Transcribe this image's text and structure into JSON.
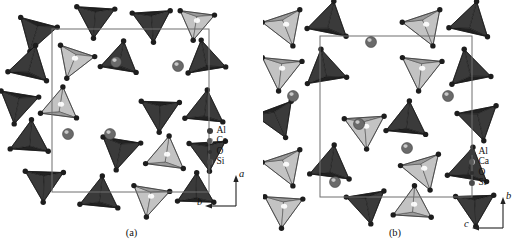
{
  "figure": {
    "type": "crystal-structure-projection-pair",
    "background_color": "#ffffff",
    "panels": [
      {
        "id": "a",
        "caption": "(a)",
        "legend": {
          "entries": [
            {
              "label": "Al",
              "marker": "filled-dark-circle",
              "color": "#3b3b3b",
              "size_px": 6
            },
            {
              "label": "Ca",
              "marker": "shaded-circle",
              "color": "#5a5a5a",
              "size_px": 6
            },
            {
              "label": "O",
              "marker": "small-dark-circle",
              "color": "#2e2e2e",
              "size_px": 4
            },
            {
              "label": "Si",
              "marker": "crescent-circle",
              "color": "#4a4a4a",
              "size_px": 6
            }
          ]
        },
        "axes": {
          "vertical": {
            "label": "a",
            "direction": "up"
          },
          "horizontal": {
            "label": "b",
            "direction": "left"
          }
        }
      },
      {
        "id": "b",
        "caption": "(b)",
        "legend": {
          "entries": [
            {
              "label": "Al",
              "marker": "filled-dark-circle",
              "color": "#3b3b3b",
              "size_px": 6
            },
            {
              "label": "Ca",
              "marker": "shaded-circle",
              "color": "#5a5a5a",
              "size_px": 6
            },
            {
              "label": "O",
              "marker": "small-dark-circle",
              "color": "#2e2e2e",
              "size_px": 4
            },
            {
              "label": "Si",
              "marker": "crescent-circle",
              "color": "#4a4a4a",
              "size_px": 6
            }
          ]
        },
        "axes": {
          "vertical": {
            "label": "b",
            "direction": "up"
          },
          "horizontal": {
            "label": "c",
            "direction": "left"
          }
        }
      }
    ]
  },
  "chart_data": {
    "type": "scatter",
    "title": "",
    "xlabel": "",
    "ylabel": "",
    "grid": false,
    "legend_position": "inside-lower-right",
    "panel_a": {
      "projection_axes": [
        "a",
        "b"
      ],
      "unit_cell_box": {
        "x": 52,
        "y": 29,
        "width": 157,
        "height": 163
      },
      "tetrahedra": [
        {
          "cx": 36,
          "cy": 32,
          "r": 22,
          "rot": 196,
          "shade": "dark"
        },
        {
          "cx": 95,
          "cy": 18,
          "r": 22,
          "rot": 184,
          "shade": "dark"
        },
        {
          "cx": 152,
          "cy": 22,
          "r": 22,
          "rot": 176,
          "shade": "dark"
        },
        {
          "cx": 196,
          "cy": 22,
          "r": 20,
          "rot": 188,
          "shade": "light"
        },
        {
          "cx": 30,
          "cy": 66,
          "r": 23,
          "rot": 14,
          "shade": "dark"
        },
        {
          "cx": 74,
          "cy": 60,
          "r": 21,
          "rot": 200,
          "shade": "light"
        },
        {
          "cx": 120,
          "cy": 60,
          "r": 21,
          "rot": 10,
          "shade": "dark"
        },
        {
          "cx": 205,
          "cy": 60,
          "r": 22,
          "rot": 350,
          "shade": "dark"
        },
        {
          "cx": 18,
          "cy": 104,
          "r": 22,
          "rot": 190,
          "shade": "dark"
        },
        {
          "cx": 60,
          "cy": 106,
          "r": 21,
          "rot": 8,
          "shade": "light"
        },
        {
          "cx": 160,
          "cy": 112,
          "r": 22,
          "rot": 182,
          "shade": "dark"
        },
        {
          "cx": 205,
          "cy": 110,
          "r": 22,
          "rot": 6,
          "shade": "dark"
        },
        {
          "cx": 30,
          "cy": 140,
          "r": 22,
          "rot": 4,
          "shade": "dark"
        },
        {
          "cx": 120,
          "cy": 150,
          "r": 22,
          "rot": 190,
          "shade": "dark"
        },
        {
          "cx": 166,
          "cy": 156,
          "r": 22,
          "rot": 8,
          "shade": "light"
        },
        {
          "cx": 208,
          "cy": 152,
          "r": 21,
          "rot": 176,
          "shade": "dark"
        },
        {
          "cx": 44,
          "cy": 182,
          "r": 22,
          "rot": 182,
          "shade": "dark"
        },
        {
          "cx": 100,
          "cy": 196,
          "r": 22,
          "rot": 6,
          "shade": "dark"
        },
        {
          "cx": 150,
          "cy": 198,
          "r": 21,
          "rot": 190,
          "shade": "light"
        },
        {
          "cx": 196,
          "cy": 192,
          "r": 21,
          "rot": 2,
          "shade": "dark"
        }
      ],
      "cations": [
        {
          "cx": 116,
          "cy": 62,
          "r": 5.5,
          "label": "Ca"
        },
        {
          "cx": 178,
          "cy": 66,
          "r": 5.5,
          "label": "Ca"
        },
        {
          "cx": 68,
          "cy": 134,
          "r": 5.5,
          "label": "Ca"
        },
        {
          "cx": 110,
          "cy": 134,
          "r": 5.5,
          "label": "Ca"
        }
      ]
    },
    "panel_b": {
      "projection_axes": [
        "b",
        "c"
      ],
      "unit_cell_box": {
        "x": 57,
        "y": 36,
        "width": 152,
        "height": 161
      },
      "tetrahedra": [
        {
          "cx": 22,
          "cy": 26,
          "r": 23,
          "rot": 160,
          "shade": "light"
        },
        {
          "cx": 66,
          "cy": 22,
          "r": 23,
          "rot": 12,
          "shade": "dark"
        },
        {
          "cx": 162,
          "cy": 26,
          "r": 23,
          "rot": 160,
          "shade": "light"
        },
        {
          "cx": 208,
          "cy": 22,
          "r": 23,
          "rot": 14,
          "shade": "dark"
        },
        {
          "cx": 18,
          "cy": 70,
          "r": 23,
          "rot": 186,
          "shade": "light"
        },
        {
          "cx": 62,
          "cy": 70,
          "r": 23,
          "rot": 350,
          "shade": "dark"
        },
        {
          "cx": 158,
          "cy": 70,
          "r": 23,
          "rot": 186,
          "shade": "light"
        },
        {
          "cx": 206,
          "cy": 70,
          "r": 23,
          "rot": 348,
          "shade": "dark"
        },
        {
          "cx": 14,
          "cy": 118,
          "r": 23,
          "rot": 158,
          "shade": "dark"
        },
        {
          "cx": 102,
          "cy": 128,
          "r": 23,
          "rot": 176,
          "shade": "light"
        },
        {
          "cx": 144,
          "cy": 122,
          "r": 23,
          "rot": 6,
          "shade": "dark"
        },
        {
          "cx": 216,
          "cy": 120,
          "r": 23,
          "rot": 168,
          "shade": "dark"
        },
        {
          "cx": 22,
          "cy": 166,
          "r": 23,
          "rot": 160,
          "shade": "light"
        },
        {
          "cx": 68,
          "cy": 166,
          "r": 23,
          "rot": 8,
          "shade": "dark"
        },
        {
          "cx": 160,
          "cy": 170,
          "r": 23,
          "rot": 162,
          "shade": "light"
        },
        {
          "cx": 206,
          "cy": 168,
          "r": 23,
          "rot": 10,
          "shade": "dark"
        },
        {
          "cx": 20,
          "cy": 208,
          "r": 22,
          "rot": 184,
          "shade": "light"
        },
        {
          "cx": 104,
          "cy": 204,
          "r": 22,
          "rot": 170,
          "shade": "dark"
        },
        {
          "cx": 150,
          "cy": 206,
          "r": 22,
          "rot": 4,
          "shade": "light"
        },
        {
          "cx": 212,
          "cy": 206,
          "r": 22,
          "rot": 178,
          "shade": "dark"
        }
      ],
      "cations": [
        {
          "cx": 30,
          "cy": 96,
          "r": 5.5,
          "label": "Ca"
        },
        {
          "cx": 108,
          "cy": 42,
          "r": 5.5,
          "label": "Ca"
        },
        {
          "cx": 185,
          "cy": 96,
          "r": 5.5,
          "label": "Ca"
        },
        {
          "cx": 96,
          "cy": 124,
          "r": 5.5,
          "label": "Ca"
        },
        {
          "cx": 144,
          "cy": 148,
          "r": 5.5,
          "label": "Ca"
        },
        {
          "cx": 72,
          "cy": 182,
          "r": 5.5,
          "label": "Ca"
        }
      ]
    }
  }
}
